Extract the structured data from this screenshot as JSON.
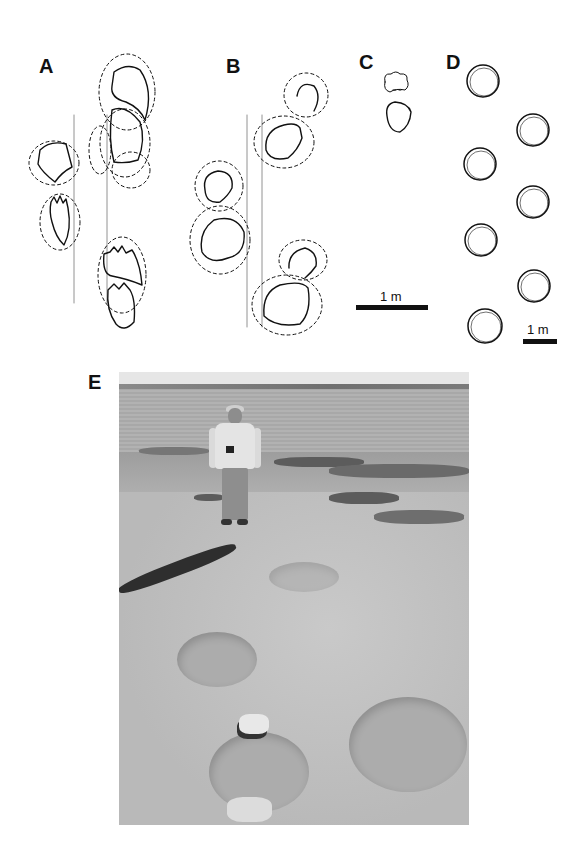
{
  "figure": {
    "panels": [
      {
        "id": "A",
        "label": "A",
        "type": "drawing",
        "content": "trackway outline with paired pes/manus prints, dashed displacement rims and two vertical midline guide lines"
      },
      {
        "id": "B",
        "label": "B",
        "type": "drawing",
        "content": "trackway outline with rounded prints, dashed displacement rims and two vertical guide lines"
      },
      {
        "id": "C",
        "label": "C",
        "type": "drawing",
        "content": "single manus-pes set outline"
      },
      {
        "id": "D",
        "label": "D",
        "type": "drawing",
        "content": "seven circular footprints in alternating trackway"
      },
      {
        "id": "E",
        "label": "E",
        "type": "photograph",
        "content": "person standing on track-bearing rock surface by a lake, with large circular footprint depressions in the foreground"
      }
    ],
    "scale_bars": [
      {
        "id": "scale-c",
        "label": "1 m",
        "applies_to": "A-C"
      },
      {
        "id": "scale-d",
        "label": "1 m",
        "applies_to": "D"
      }
    ]
  }
}
